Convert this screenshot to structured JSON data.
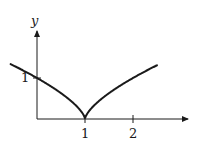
{
  "chart_data": {
    "type": "line",
    "title": "",
    "xlabel": "",
    "ylabel": "y",
    "function": "y = |x - 1|^(2/3)",
    "x_ticks": [
      "1",
      "2"
    ],
    "y_ticks": [
      "1"
    ],
    "xlim": [
      -0.55,
      3.1
    ],
    "ylim": [
      0,
      2.1
    ],
    "grid": false,
    "legend": null,
    "series": [
      {
        "name": "curve",
        "x": [
          -0.5,
          -0.25,
          0,
          0.25,
          0.5,
          0.75,
          0.9,
          1,
          1.1,
          1.25,
          1.5,
          1.75,
          2,
          2.25,
          2.5
        ],
        "y": [
          1.31,
          1.16,
          1.0,
          0.83,
          0.63,
          0.4,
          0.22,
          0,
          0.22,
          0.4,
          0.63,
          0.83,
          1.0,
          1.16,
          1.31
        ]
      }
    ],
    "annotations": [
      "cusp at x = 1"
    ]
  },
  "labels": {
    "y_axis": "y",
    "x_tick_1": "1",
    "x_tick_2": "2",
    "y_tick_1": "1"
  }
}
